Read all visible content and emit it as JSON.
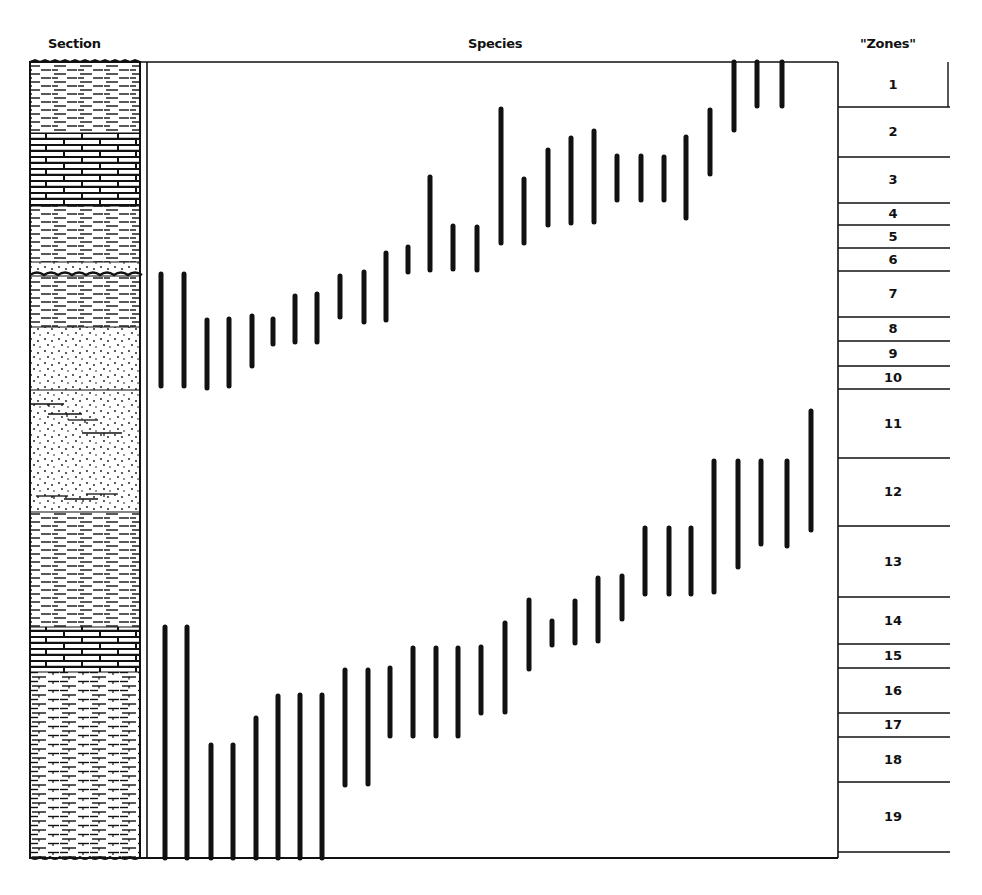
{
  "headers": {
    "section": "Section",
    "species": "Species",
    "zones": "\"Zones\""
  },
  "colors": {
    "ink": "#111111",
    "paper": "#ffffff"
  },
  "layout": {
    "section_column": {
      "x1": 30,
      "x2": 140
    },
    "species_panel": {
      "x1": 147,
      "x2": 838,
      "y_top": 62,
      "y_bottom": 858
    },
    "zones_column": {
      "x1": 838,
      "x2": 948
    }
  },
  "section_layers": [
    {
      "name": "shale",
      "y1": 62,
      "y2": 133,
      "pattern": "dash"
    },
    {
      "name": "limestone",
      "y1": 133,
      "y2": 206,
      "pattern": "brick"
    },
    {
      "name": "shale",
      "y1": 206,
      "y2": 262,
      "pattern": "dash"
    },
    {
      "name": "sandy-shale",
      "y1": 262,
      "y2": 274,
      "pattern": "dots"
    },
    {
      "name": "unconformity",
      "y1": 274,
      "y2": 276,
      "pattern": "wavy"
    },
    {
      "name": "shale",
      "y1": 276,
      "y2": 327,
      "pattern": "dash"
    },
    {
      "name": "sandstone",
      "y1": 327,
      "y2": 390,
      "pattern": "dots"
    },
    {
      "name": "sandstone-with-shale-lenses",
      "y1": 390,
      "y2": 512,
      "pattern": "dots-lenses"
    },
    {
      "name": "shale",
      "y1": 512,
      "y2": 627,
      "pattern": "dash"
    },
    {
      "name": "limestone",
      "y1": 627,
      "y2": 672,
      "pattern": "brick"
    },
    {
      "name": "calcareous-shale",
      "y1": 672,
      "y2": 858,
      "pattern": "dash-ticked"
    }
  ],
  "zones": [
    {
      "label": "1",
      "y1": 62,
      "y2": 107
    },
    {
      "label": "2",
      "y1": 107,
      "y2": 157
    },
    {
      "label": "3",
      "y1": 157,
      "y2": 203
    },
    {
      "label": "4",
      "y1": 203,
      "y2": 225
    },
    {
      "label": "5",
      "y1": 225,
      "y2": 248
    },
    {
      "label": "6",
      "y1": 248,
      "y2": 271
    },
    {
      "label": "7",
      "y1": 271,
      "y2": 317
    },
    {
      "label": "8",
      "y1": 317,
      "y2": 341
    },
    {
      "label": "9",
      "y1": 341,
      "y2": 366
    },
    {
      "label": "10",
      "y1": 366,
      "y2": 389
    },
    {
      "label": "11",
      "y1": 389,
      "y2": 458
    },
    {
      "label": "12",
      "y1": 458,
      "y2": 526
    },
    {
      "label": "13",
      "y1": 526,
      "y2": 597
    },
    {
      "label": "14",
      "y1": 597,
      "y2": 644
    },
    {
      "label": "15",
      "y1": 644,
      "y2": 668
    },
    {
      "label": "16",
      "y1": 668,
      "y2": 713
    },
    {
      "label": "17",
      "y1": 713,
      "y2": 737
    },
    {
      "label": "18",
      "y1": 737,
      "y2": 782
    },
    {
      "label": "19",
      "y1": 782,
      "y2": 852
    }
  ],
  "species_ranges_upper": [
    {
      "x": 161,
      "y1": 274,
      "y2": 386
    },
    {
      "x": 184,
      "y1": 274,
      "y2": 386
    },
    {
      "x": 207,
      "y1": 320,
      "y2": 388
    },
    {
      "x": 229,
      "y1": 319,
      "y2": 386
    },
    {
      "x": 252,
      "y1": 316,
      "y2": 366
    },
    {
      "x": 273,
      "y1": 319,
      "y2": 344
    },
    {
      "x": 295,
      "y1": 296,
      "y2": 342
    },
    {
      "x": 317,
      "y1": 294,
      "y2": 342
    },
    {
      "x": 340,
      "y1": 276,
      "y2": 317
    },
    {
      "x": 364,
      "y1": 272,
      "y2": 322
    },
    {
      "x": 386,
      "y1": 253,
      "y2": 320
    },
    {
      "x": 408,
      "y1": 247,
      "y2": 272
    },
    {
      "x": 430,
      "y1": 177,
      "y2": 270
    },
    {
      "x": 453,
      "y1": 226,
      "y2": 269
    },
    {
      "x": 477,
      "y1": 227,
      "y2": 270
    },
    {
      "x": 501,
      "y1": 109,
      "y2": 243
    },
    {
      "x": 524,
      "y1": 179,
      "y2": 243
    },
    {
      "x": 548,
      "y1": 150,
      "y2": 225
    },
    {
      "x": 571,
      "y1": 138,
      "y2": 223
    },
    {
      "x": 594,
      "y1": 131,
      "y2": 222
    },
    {
      "x": 617,
      "y1": 156,
      "y2": 200
    },
    {
      "x": 641,
      "y1": 156,
      "y2": 200
    },
    {
      "x": 664,
      "y1": 157,
      "y2": 200
    },
    {
      "x": 686,
      "y1": 137,
      "y2": 218
    },
    {
      "x": 710,
      "y1": 110,
      "y2": 174
    },
    {
      "x": 734,
      "y1": 62,
      "y2": 130
    },
    {
      "x": 757,
      "y1": 62,
      "y2": 106
    },
    {
      "x": 782,
      "y1": 62,
      "y2": 106
    }
  ],
  "species_ranges_lower": [
    {
      "x": 165,
      "y1": 627,
      "y2": 858
    },
    {
      "x": 187,
      "y1": 627,
      "y2": 858
    },
    {
      "x": 211,
      "y1": 745,
      "y2": 858
    },
    {
      "x": 233,
      "y1": 745,
      "y2": 858
    },
    {
      "x": 256,
      "y1": 718,
      "y2": 858
    },
    {
      "x": 278,
      "y1": 696,
      "y2": 858
    },
    {
      "x": 300,
      "y1": 695,
      "y2": 858
    },
    {
      "x": 322,
      "y1": 695,
      "y2": 858
    },
    {
      "x": 345,
      "y1": 670,
      "y2": 785
    },
    {
      "x": 368,
      "y1": 670,
      "y2": 784
    },
    {
      "x": 390,
      "y1": 668,
      "y2": 736
    },
    {
      "x": 413,
      "y1": 648,
      "y2": 736
    },
    {
      "x": 436,
      "y1": 648,
      "y2": 736
    },
    {
      "x": 458,
      "y1": 648,
      "y2": 736
    },
    {
      "x": 481,
      "y1": 647,
      "y2": 713
    },
    {
      "x": 505,
      "y1": 623,
      "y2": 712
    },
    {
      "x": 529,
      "y1": 600,
      "y2": 669
    },
    {
      "x": 552,
      "y1": 621,
      "y2": 645
    },
    {
      "x": 575,
      "y1": 601,
      "y2": 643
    },
    {
      "x": 598,
      "y1": 578,
      "y2": 641
    },
    {
      "x": 622,
      "y1": 576,
      "y2": 619
    },
    {
      "x": 645,
      "y1": 528,
      "y2": 594
    },
    {
      "x": 669,
      "y1": 528,
      "y2": 594
    },
    {
      "x": 691,
      "y1": 528,
      "y2": 594
    },
    {
      "x": 714,
      "y1": 461,
      "y2": 592
    },
    {
      "x": 738,
      "y1": 461,
      "y2": 567
    },
    {
      "x": 761,
      "y1": 461,
      "y2": 544
    },
    {
      "x": 787,
      "y1": 461,
      "y2": 546
    },
    {
      "x": 811,
      "y1": 411,
      "y2": 530
    }
  ]
}
